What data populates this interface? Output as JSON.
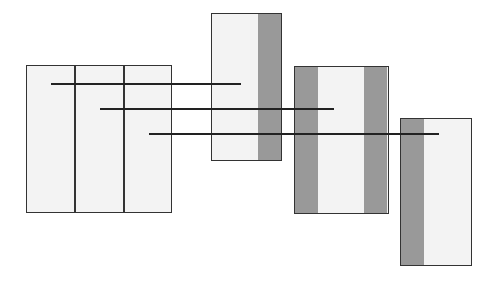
{
  "diagram": {
    "colors": {
      "light_fill": "#f3f3f3",
      "dark_fill": "#999999",
      "stroke": "#333333"
    },
    "source_box": {
      "x": 26,
      "y": 65,
      "w": 146,
      "h": 148,
      "columns": 3,
      "divider_x": [
        49,
        98
      ]
    },
    "target_boxes": [
      {
        "id": "box-1",
        "x": 211,
        "y": 13,
        "w": 70,
        "h": 147,
        "dark_strips": [
          {
            "x": 47,
            "w": 23
          }
        ]
      },
      {
        "id": "box-2",
        "x": 294,
        "y": 66,
        "w": 94,
        "h": 147,
        "dark_strips": [
          {
            "x": 0,
            "w": 24
          },
          {
            "x": 70,
            "w": 24
          }
        ]
      },
      {
        "id": "box-3",
        "x": 400,
        "y": 118,
        "w": 71,
        "h": 147,
        "dark_strips": [
          {
            "x": 0,
            "w": 24
          }
        ]
      }
    ],
    "connectors": [
      {
        "id": "line-1",
        "x1": 51,
        "x2": 241,
        "y": 84
      },
      {
        "id": "line-2",
        "x1": 100,
        "x2": 334,
        "y": 109
      },
      {
        "id": "line-3",
        "x1": 149,
        "x2": 439,
        "y": 134
      }
    ]
  }
}
